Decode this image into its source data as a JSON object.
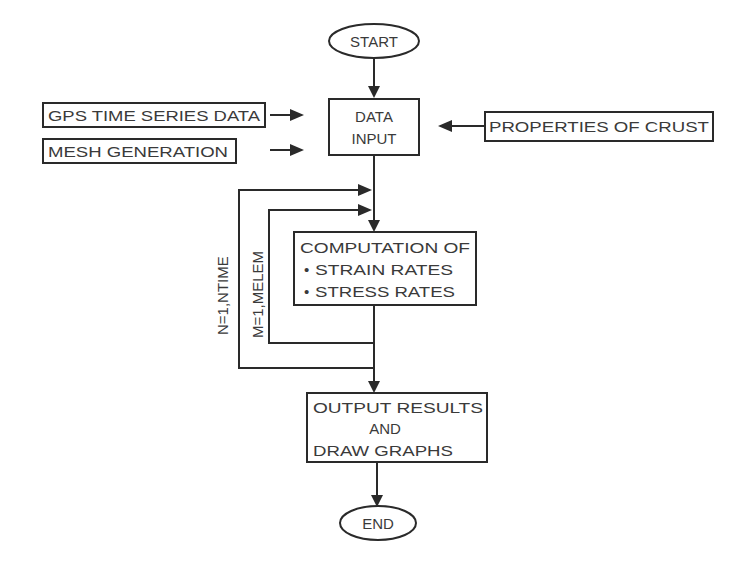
{
  "diagram": {
    "type": "flowchart",
    "nodes": {
      "start": {
        "label": "START",
        "shape": "ellipse"
      },
      "gps": {
        "label": "GPS TIME SERIES DATA",
        "shape": "rect"
      },
      "mesh": {
        "label": "MESH GENERATION",
        "shape": "rect"
      },
      "data_input": {
        "line1": "DATA",
        "line2": "INPUT",
        "shape": "rect"
      },
      "crust": {
        "label": "PROPERTIES OF CRUST",
        "shape": "rect"
      },
      "computation": {
        "line1": "COMPUTATION OF",
        "line2": "STRAIN RATES",
        "line3": "STRESS RATES",
        "bullet": "•",
        "shape": "rect"
      },
      "output": {
        "line1": "OUTPUT RESULTS",
        "line2": "AND",
        "line3": "DRAW GRAPHS",
        "shape": "rect"
      },
      "end": {
        "label": "END",
        "shape": "ellipse"
      }
    },
    "loops": {
      "outer": {
        "label": "N=1,NTIME"
      },
      "inner": {
        "label": "M=1,MELEM"
      }
    },
    "edges": [
      {
        "from": "start",
        "to": "data_input"
      },
      {
        "from": "gps",
        "to": "data_input"
      },
      {
        "from": "mesh",
        "to": "data_input"
      },
      {
        "from": "crust",
        "to": "data_input"
      },
      {
        "from": "data_input",
        "to": "computation"
      },
      {
        "from": "computation",
        "to": "output"
      },
      {
        "from": "output",
        "to": "end"
      }
    ],
    "colors": {
      "stroke": "#2a2a2a",
      "text": "#3a3a3a",
      "background": "#ffffff"
    }
  }
}
